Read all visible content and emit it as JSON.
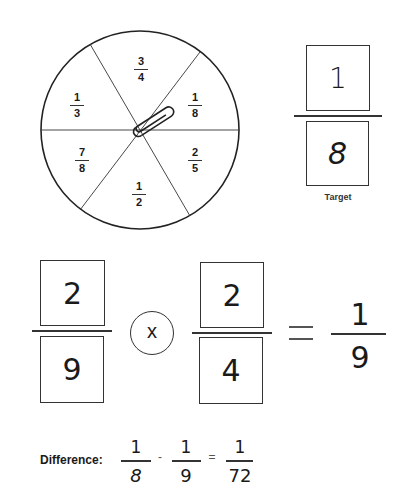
{
  "spinner": {
    "sections": [
      {
        "numerator": "3",
        "denominator": "4"
      },
      {
        "numerator": "1",
        "denominator": "8"
      },
      {
        "numerator": "2",
        "denominator": "5"
      },
      {
        "numerator": "1",
        "denominator": "2"
      },
      {
        "numerator": "7",
        "denominator": "8"
      },
      {
        "numerator": "1",
        "denominator": "3"
      }
    ],
    "pointer": "paperclip-icon"
  },
  "target": {
    "numerator": "1",
    "denominator": "8",
    "label": "Target"
  },
  "equation": {
    "left": {
      "numerator": "2",
      "denominator": "9"
    },
    "operator": "x",
    "right": {
      "numerator": "2",
      "denominator": "4"
    },
    "equals": "=",
    "result": {
      "numerator": "1",
      "denominator": "9"
    }
  },
  "difference": {
    "label": "Difference:",
    "a": {
      "numerator": "1",
      "denominator": "8"
    },
    "minus": "-",
    "b": {
      "numerator": "1",
      "denominator": "9"
    },
    "equals": "=",
    "result": {
      "numerator": "1",
      "denominator": "72"
    }
  }
}
